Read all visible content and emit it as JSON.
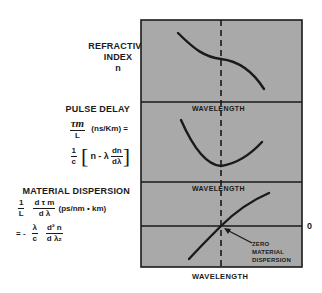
{
  "refractive_index": {
    "title_line1": "REFRACTIVE",
    "title_line2": "INDEX",
    "symbol": "n"
  },
  "pulse_delay": {
    "title": "PULSE DELAY",
    "frac_num": "τm",
    "frac_den": "L",
    "units": "(ns/Km) =",
    "eq_frac_num": "1",
    "eq_frac_den": "c",
    "bracket_open": "[",
    "eq_body": "n - λ",
    "deriv_num": "dn",
    "deriv_den": "dλ",
    "bracket_close": "]"
  },
  "material_dispersion": {
    "title": "MATERIAL DISPERSION",
    "frac1_num": "1",
    "frac1_den": "L",
    "frac2_num": "d τ m",
    "frac2_den": "d λ",
    "units": "(ps/nm • km)",
    "eq_prefix": "= -",
    "frac3_num": "λ",
    "frac3_den": "c",
    "frac4_num": "d² n",
    "frac4_den": "d λ₂"
  },
  "axis_labels": {
    "panel1_xlabel": "WAVELENGTH",
    "panel2_xlabel": "WAVELENGTH",
    "panel3_xlabel": "WAVELENGTH",
    "zero_label": "0"
  },
  "annotation": {
    "line1": "ZERO",
    "line2": "MATERIAL",
    "line3": "DISPERSION"
  },
  "colors": {
    "panel_fill": "#a9a9a9",
    "ink": "#1a1a1a",
    "background": "#ffffff"
  }
}
